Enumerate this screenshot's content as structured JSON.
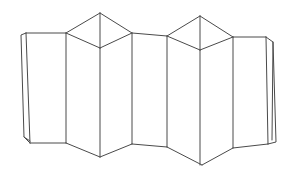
{
  "figure": {
    "title": "Accordion folded sheet",
    "view": "three-quarter perspective",
    "background_color": "#ffffff",
    "line_color": "#4a4a4a",
    "line_width": 1,
    "fill_color": "#ffffff",
    "width": 290,
    "height": 175,
    "peak_count": 2,
    "panel_count": 8,
    "geometry": {
      "outline": "M 26,33 L 66,33 L 100,13 L 132,33 L 167,36 L 200,16 L 233,37 L 266,37 L 268,144 L 265,148 L 233,148 L 202,165 L 167,147 L 132,144 L 100,157 L 66,143 L 30,143 Z",
      "vertical_folds": [
        "M 66,33 L 66,143",
        "M 100,13 L 100,48",
        "M 100,48 L 100,157",
        "M 132,33 L 132,144",
        "M 167,36 L 167,147",
        "M 200,16 L 200,50",
        "M 200,50 L 200,165",
        "M 233,37 L 233,148"
      ],
      "peak_ridges": [
        "M 66,33 L 100,48 L 132,33",
        "M 167,36 L 200,50 L 233,37"
      ],
      "left_flap": "M 26,33 L 21,35 L 24,137 L 30,143",
      "left_flap_inner": "M 24,137 L 30,140",
      "right_flap": "M 266,37 L 272,41 L 276,142 L 268,144",
      "right_flap_inner": "M 272,41 L 272,140"
    }
  }
}
